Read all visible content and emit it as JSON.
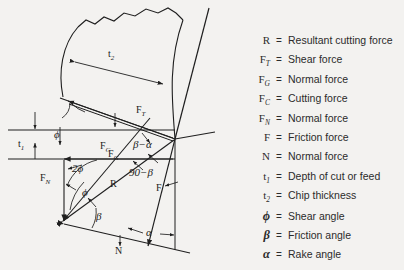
{
  "figure": {
    "background_color": "#f3f2f0",
    "line_color": "#1f1f1f"
  },
  "legend": {
    "entries": [
      {
        "symbol": "R",
        "sub": "",
        "greek": false,
        "eq": "=",
        "text": "Resultant cutting force"
      },
      {
        "symbol": "F",
        "sub": "T",
        "greek": false,
        "eq": "=",
        "text": "Shear force"
      },
      {
        "symbol": "F",
        "sub": "G",
        "greek": false,
        "eq": "=",
        "text": "Normal force"
      },
      {
        "symbol": "F",
        "sub": "C",
        "greek": false,
        "eq": "=",
        "text": "Cutting force"
      },
      {
        "symbol": "F",
        "sub": "N",
        "greek": false,
        "eq": "=",
        "text": "Normal force"
      },
      {
        "symbol": "F",
        "sub": "",
        "greek": false,
        "eq": "=",
        "text": "Friction force"
      },
      {
        "symbol": "N",
        "sub": "",
        "greek": false,
        "eq": "=",
        "text": "Normal force"
      },
      {
        "symbol": "t",
        "sub": "1",
        "greek": false,
        "eq": "=",
        "text": "Depth of cut or feed"
      },
      {
        "symbol": "t",
        "sub": "2",
        "greek": false,
        "eq": "=",
        "text": "Chip thickness"
      },
      {
        "symbol": "ϕ",
        "sub": "",
        "greek": true,
        "eq": "=",
        "text": "Shear angle"
      },
      {
        "symbol": "β",
        "sub": "",
        "greek": true,
        "eq": "=",
        "text": "Friction angle"
      },
      {
        "symbol": "α",
        "sub": "",
        "greek": true,
        "eq": "=",
        "text": "Rake angle"
      }
    ]
  },
  "diagram_labels": {
    "t1": {
      "text": "t",
      "sub": "1"
    },
    "t2": {
      "text": "t",
      "sub": "2"
    },
    "phi_depth": {
      "text": "ϕ"
    },
    "Fc": {
      "text": "F",
      "sub": "C"
    },
    "Ft": {
      "text": "F",
      "sub": "T"
    },
    "Fg": {
      "text": "F",
      "sub": "G"
    },
    "Fn": {
      "text": "F",
      "sub": "N"
    },
    "R": {
      "text": "R"
    },
    "N": {
      "text": "N"
    },
    "F": {
      "text": "F"
    },
    "two_phi": {
      "text": "2ϕ"
    },
    "phi": {
      "text": "ϕ"
    },
    "beta": {
      "text": "β"
    },
    "beta_minus_alpha": {
      "text": "β−α"
    },
    "ninety_minus_beta": {
      "text": "90−β"
    },
    "alpha": {
      "text": "α"
    }
  }
}
